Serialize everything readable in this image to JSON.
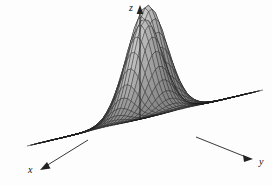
{
  "figure": {
    "type": "surface-plot",
    "background_color": "#fdfdfd",
    "mesh_line_color": "#1c1c1c",
    "surface_fill_light": "#e8e8e8",
    "surface_fill_dark": "#5a5a5a",
    "axis_color": "#222222"
  },
  "axes": {
    "z": {
      "label": "z",
      "arrow": "up"
    },
    "x": {
      "label": "x",
      "arrow": "down-left"
    },
    "y": {
      "label": "y",
      "arrow": "right"
    }
  },
  "chart_data": {
    "type": "surface",
    "title": "",
    "xlabel": "x",
    "ylabel": "y",
    "zlabel": "z",
    "grid": true,
    "legend": "none",
    "projection": "isometric-3d-wireframe",
    "shading": "grayscale-lambert",
    "xlim": [
      -3,
      3
    ],
    "ylim": [
      -3,
      3
    ],
    "zlim": [
      0,
      1
    ],
    "grid_steps": {
      "nx": 34,
      "ny": 34
    },
    "function": "sum of two gaussian peaks",
    "peaks": [
      {
        "name": "left-peak",
        "cx": -0.85,
        "cy": -0.75,
        "amplitude": 1.0,
        "sigma": 0.72
      },
      {
        "name": "right-peak",
        "cx": 0.85,
        "cy": 0.8,
        "amplitude": 0.88,
        "sigma": 0.66
      }
    ],
    "x": [
      -3.0,
      -2.5,
      -2.0,
      -1.5,
      -1.0,
      -0.5,
      0.0,
      0.5,
      1.0,
      1.5,
      2.0,
      2.5,
      3.0
    ],
    "y": [
      -3.0,
      -2.5,
      -2.0,
      -1.5,
      -1.0,
      -0.5,
      0.0,
      0.5,
      1.0,
      1.5,
      2.0,
      2.5,
      3.0
    ],
    "z_profile_along_diagonal": [
      0.0,
      0.01,
      0.05,
      0.22,
      0.63,
      0.94,
      0.46,
      0.52,
      0.84,
      0.41,
      0.09,
      0.01,
      0.0
    ]
  }
}
